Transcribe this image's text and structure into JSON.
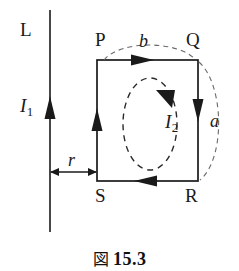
{
  "figure": {
    "caption_mark": "図",
    "caption_number": "15.3",
    "background_color": "#ffffff",
    "stroke_color": "#1a1a1a",
    "dashed_color": "#555555"
  },
  "labels": {
    "wire_name": "L",
    "wire_current": "I",
    "wire_current_sub": "1",
    "distance": "r",
    "corner_top_left": "P",
    "corner_top_right": "Q",
    "corner_bottom_right": "R",
    "corner_bottom_left": "S",
    "side_top": "b",
    "side_right": "a",
    "loop_current": "I",
    "loop_current_sub": "2"
  },
  "geometry": {
    "wire_x": 50,
    "wire_y_top": 10,
    "wire_y_bottom": 232,
    "wire_arrow_y": 112,
    "rect_left": 97,
    "rect_right": 198,
    "rect_top": 60,
    "rect_bottom": 181,
    "distance_arrow_y": 172,
    "ellipse_cx": 150,
    "ellipse_cy": 124,
    "ellipse_rx": 27,
    "ellipse_ry": 46
  }
}
